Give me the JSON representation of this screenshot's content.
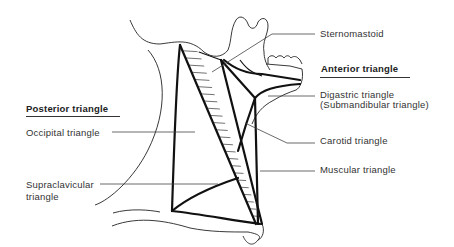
{
  "figure": {
    "labels": {
      "sternomastoid": "Sternomastoid",
      "anterior_triangle": "Anterior triangle",
      "digastric_line1": "Digastric  triangle",
      "digastric_line2": "(Submandibular triangle)",
      "carotid": "Carotid triangle",
      "muscular": "Muscular triangle",
      "posterior_triangle": "Posterior triangle",
      "occipital": "Occipital triangle",
      "supraclavicular_line1": "Supraclavicular",
      "supraclavicular_line2": "triangle"
    },
    "groups": [
      {
        "heading": "Anterior triangle",
        "members": [
          "Digastric triangle (Submandibular triangle)",
          "Carotid triangle",
          "Muscular triangle"
        ]
      },
      {
        "heading": "Posterior triangle",
        "members": [
          "Occipital triangle",
          "Supraclavicular triangle"
        ]
      }
    ],
    "colors": {
      "ink": "#222222",
      "background": "#ffffff"
    }
  }
}
